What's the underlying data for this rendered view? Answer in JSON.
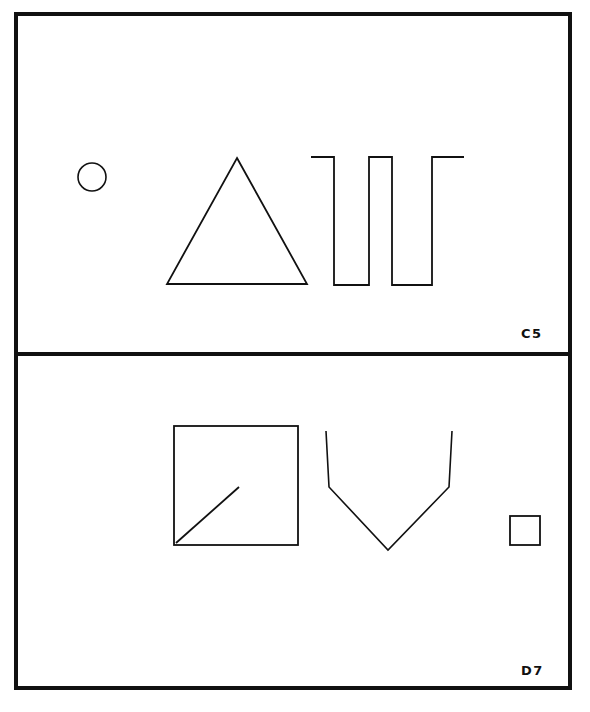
{
  "figure": {
    "kind": "line-drawing-plate",
    "background_color": "#ffffff",
    "ink_color": "#111111",
    "frame": {
      "x": 16,
      "y": 14,
      "width": 554,
      "height": 674,
      "stroke_width": 4
    },
    "divider": {
      "y": 354,
      "x1": 16,
      "x2": 570,
      "stroke_width": 4
    }
  },
  "panels": [
    {
      "id": "panel-top",
      "label": "C5",
      "label_position": {
        "x": 521,
        "y": 327
      },
      "bounds": {
        "x": 16,
        "y": 14,
        "width": 554,
        "height": 340
      },
      "shapes": [
        {
          "name": "circle",
          "type": "circle",
          "cx": 92,
          "cy": 177,
          "r": 14,
          "stroke_width": 1.6,
          "fill": "none"
        },
        {
          "name": "triangle",
          "type": "polygon",
          "points": "237,158 307,284 167,284",
          "stroke_width": 1.8,
          "fill": "none"
        },
        {
          "name": "square-wave",
          "type": "polyline",
          "points": "311,157 334,157 334,285 369,285 369,157 392,157 392,285 432,285 432,157 464,157",
          "stroke_width": 1.8,
          "fill": "none"
        }
      ]
    },
    {
      "id": "panel-bottom",
      "label": "D7",
      "label_position": {
        "x": 521,
        "y": 664
      },
      "bounds": {
        "x": 16,
        "y": 354,
        "width": 554,
        "height": 334
      },
      "shapes": [
        {
          "name": "large-square",
          "type": "rect",
          "x": 174,
          "y": 426,
          "width": 124,
          "height": 119,
          "stroke_width": 1.8,
          "fill": "none"
        },
        {
          "name": "diagonal-line",
          "type": "line",
          "x1": 176,
          "y1": 543,
          "x2": 239,
          "y2": 487,
          "stroke_width": 1.8
        },
        {
          "name": "v-chevron",
          "type": "polyline",
          "points": "326,431 329,487 388,550 449,487 452,431",
          "stroke_width": 1.6,
          "fill": "none"
        },
        {
          "name": "small-square",
          "type": "rect",
          "x": 510,
          "y": 516,
          "width": 30,
          "height": 29,
          "stroke_width": 1.8,
          "fill": "none"
        }
      ]
    }
  ]
}
